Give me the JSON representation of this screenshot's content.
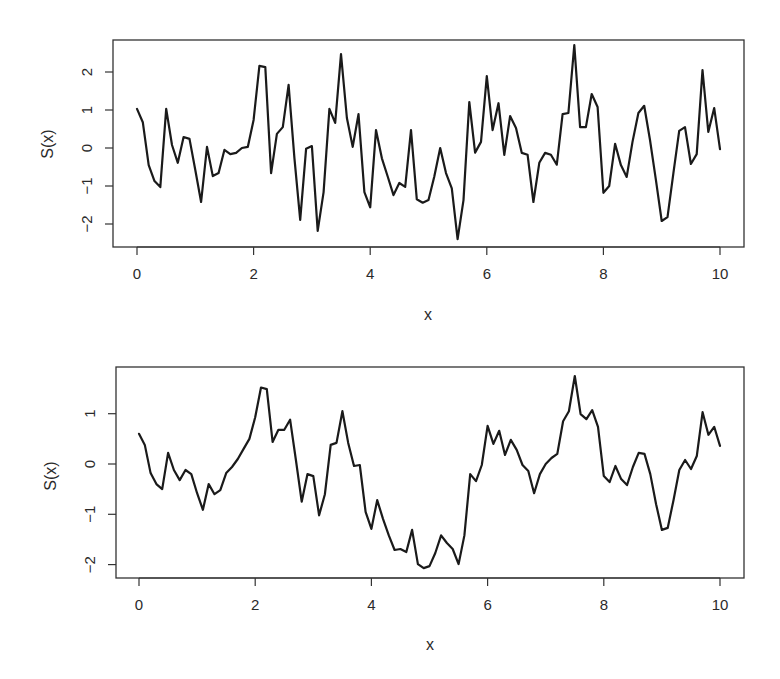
{
  "figure": {
    "background": "#ffffff",
    "line_color": "#1a1a1a",
    "axis_color": "#333333"
  },
  "chart_data": [
    {
      "type": "line",
      "title": "",
      "xlabel": "x",
      "ylabel": "S(x)",
      "xlim": [
        -0.4,
        10.4
      ],
      "ylim": [
        -2.6,
        2.8
      ],
      "xticks": [
        0,
        2,
        4,
        6,
        8,
        10
      ],
      "xtick_labels": [
        "0",
        "2",
        "4",
        "6",
        "8",
        "10"
      ],
      "yticks": [
        -2,
        -1,
        0,
        1,
        2
      ],
      "ytick_labels": [
        "−2",
        "−1",
        "0",
        "1",
        "2"
      ],
      "grid": false,
      "legend": null,
      "layout": {
        "box": [
          113,
          40,
          744,
          247
        ],
        "x0_px": 137,
        "x_per_unit": 58.3,
        "y0_px": 148,
        "y_per_unit": 38
      },
      "x": [
        0,
        0.1,
        0.2,
        0.3,
        0.4,
        0.5,
        0.6,
        0.7,
        0.8,
        0.9,
        1,
        1.1,
        1.2,
        1.3,
        1.4,
        1.5,
        1.6,
        1.7,
        1.8,
        1.9,
        2,
        2.1,
        2.2,
        2.3,
        2.4,
        2.5,
        2.6,
        2.7,
        2.8,
        2.9,
        3,
        3.1,
        3.2,
        3.3,
        3.4,
        3.5,
        3.6,
        3.7,
        3.8,
        3.9,
        4,
        4.1,
        4.2,
        4.3,
        4.4,
        4.5,
        4.6,
        4.7,
        4.8,
        4.9,
        5,
        5.1,
        5.2,
        5.3,
        5.4,
        5.5,
        5.6,
        5.7,
        5.8,
        5.9,
        6,
        6.1,
        6.2,
        6.3,
        6.4,
        6.5,
        6.6,
        6.7,
        6.8,
        6.9,
        7,
        7.1,
        7.2,
        7.3,
        7.4,
        7.5,
        7.6,
        7.7,
        7.8,
        7.9,
        8,
        8.1,
        8.2,
        8.3,
        8.4,
        8.5,
        8.6,
        8.7,
        8.8,
        8.9,
        9,
        9.1,
        9.2,
        9.3,
        9.4,
        9.5,
        9.6,
        9.7,
        9.8,
        9.9,
        10
      ],
      "series": [
        {
          "name": "S(x)",
          "values": [
            1.03,
            0.68,
            -0.45,
            -0.87,
            -1.03,
            1.03,
            0.08,
            -0.39,
            0.29,
            0.24,
            -0.58,
            -1.42,
            0.03,
            -0.74,
            -0.66,
            -0.05,
            -0.16,
            -0.13,
            0.0,
            0.03,
            0.74,
            2.16,
            2.13,
            -0.66,
            0.37,
            0.55,
            1.66,
            -0.26,
            -1.89,
            -0.02,
            0.05,
            -2.18,
            -1.16,
            1.03,
            0.66,
            2.47,
            0.79,
            0.03,
            0.89,
            -1.16,
            -1.56,
            0.47,
            -0.27,
            -0.75,
            -1.24,
            -0.92,
            -1.02,
            0.47,
            -1.35,
            -1.44,
            -1.37,
            -0.75,
            0.0,
            -0.66,
            -1.06,
            -2.4,
            -1.37,
            1.21,
            -0.12,
            0.16,
            1.89,
            0.47,
            1.18,
            -0.18,
            0.84,
            0.53,
            -0.13,
            -0.18,
            -1.42,
            -0.39,
            -0.13,
            -0.18,
            -0.44,
            0.89,
            0.92,
            2.71,
            0.55,
            0.55,
            1.42,
            1.08,
            -1.18,
            -1.0,
            0.11,
            -0.45,
            -0.76,
            0.16,
            0.92,
            1.11,
            0.21,
            -0.84,
            -1.92,
            -1.82,
            -0.66,
            0.45,
            0.55,
            -0.42,
            -0.16,
            2.05,
            0.42,
            1.05,
            -0.03
          ]
        }
      ]
    },
    {
      "type": "line",
      "title": "",
      "xlabel": "x",
      "ylabel": "S(x)",
      "xlim": [
        -0.4,
        10.4
      ],
      "ylim": [
        -2.3,
        1.9
      ],
      "xticks": [
        0,
        2,
        4,
        6,
        8,
        10
      ],
      "xtick_labels": [
        "0",
        "2",
        "4",
        "6",
        "8",
        "10"
      ],
      "yticks": [
        -2,
        -1,
        0,
        1
      ],
      "ytick_labels": [
        "−2",
        "−1",
        "0",
        "1"
      ],
      "grid": false,
      "legend": null,
      "layout": {
        "box": [
          116,
          367,
          744,
          578
        ],
        "x0_px": 139,
        "x_per_unit": 58.1,
        "y0_px": 464,
        "y_per_unit": 50.3
      },
      "x": [
        0,
        0.1,
        0.2,
        0.3,
        0.4,
        0.5,
        0.6,
        0.7,
        0.8,
        0.9,
        1,
        1.1,
        1.2,
        1.3,
        1.4,
        1.5,
        1.6,
        1.7,
        1.8,
        1.9,
        2,
        2.1,
        2.2,
        2.3,
        2.4,
        2.5,
        2.6,
        2.7,
        2.8,
        2.9,
        3,
        3.1,
        3.2,
        3.3,
        3.4,
        3.5,
        3.6,
        3.7,
        3.8,
        3.9,
        4,
        4.1,
        4.2,
        4.3,
        4.4,
        4.5,
        4.6,
        4.7,
        4.8,
        4.9,
        5,
        5.1,
        5.2,
        5.3,
        5.4,
        5.5,
        5.6,
        5.7,
        5.8,
        5.9,
        6,
        6.1,
        6.2,
        6.3,
        6.4,
        6.5,
        6.6,
        6.7,
        6.8,
        6.9,
        7,
        7.1,
        7.2,
        7.3,
        7.4,
        7.5,
        7.6,
        7.7,
        7.8,
        7.9,
        8,
        8.1,
        8.2,
        8.3,
        8.4,
        8.5,
        8.6,
        8.7,
        8.8,
        8.9,
        9,
        9.1,
        9.2,
        9.3,
        9.4,
        9.5,
        9.6,
        9.7,
        9.8,
        9.9,
        10
      ],
      "series": [
        {
          "name": "S(x)",
          "values": [
            0.6,
            0.38,
            -0.18,
            -0.4,
            -0.5,
            0.22,
            -0.12,
            -0.32,
            -0.12,
            -0.2,
            -0.58,
            -0.91,
            -0.4,
            -0.6,
            -0.52,
            -0.18,
            -0.06,
            0.1,
            0.3,
            0.5,
            0.93,
            1.52,
            1.49,
            0.44,
            0.68,
            0.68,
            0.88,
            0.08,
            -0.75,
            -0.2,
            -0.24,
            -1.02,
            -0.6,
            0.38,
            0.42,
            1.05,
            0.42,
            -0.04,
            -0.02,
            -0.95,
            -1.29,
            -0.72,
            -1.09,
            -1.42,
            -1.71,
            -1.69,
            -1.75,
            -1.31,
            -1.99,
            -2.07,
            -2.03,
            -1.77,
            -1.42,
            -1.57,
            -1.69,
            -1.99,
            -1.42,
            -0.2,
            -0.34,
            -0.02,
            0.76,
            0.4,
            0.66,
            0.18,
            0.48,
            0.28,
            -0.02,
            -0.14,
            -0.58,
            -0.2,
            0.0,
            0.12,
            0.2,
            0.85,
            1.05,
            1.75,
            0.99,
            0.89,
            1.07,
            0.74,
            -0.24,
            -0.36,
            -0.04,
            -0.3,
            -0.42,
            -0.06,
            0.22,
            0.2,
            -0.2,
            -0.8,
            -1.31,
            -1.27,
            -0.72,
            -0.12,
            0.08,
            -0.1,
            0.16,
            1.03,
            0.58,
            0.74,
            0.36
          ]
        }
      ]
    }
  ]
}
